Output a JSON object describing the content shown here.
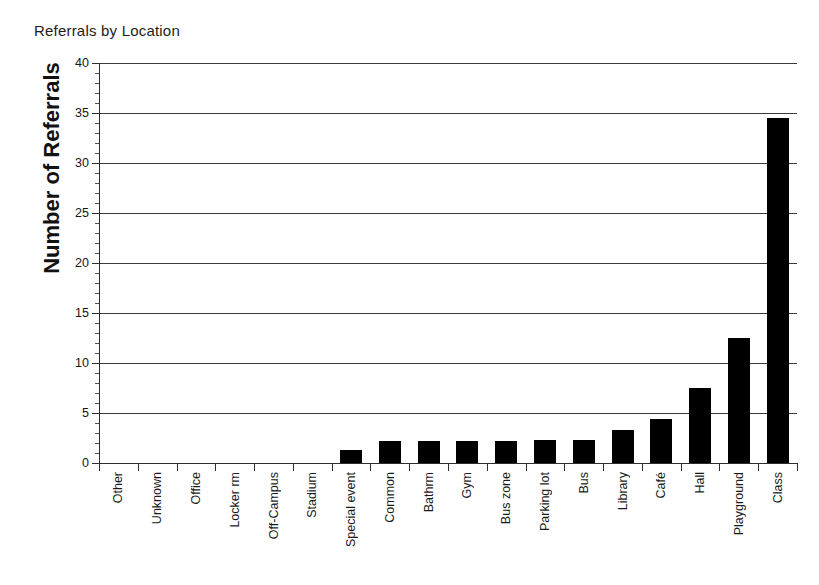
{
  "chart_data": {
    "type": "bar",
    "title": "Referrals by Location",
    "xlabel": "",
    "ylabel": "Number of Referrals",
    "ylim": [
      0,
      40
    ],
    "ytick_step": 5,
    "yminor_step": 1,
    "grid": "horizontal",
    "legend": "none",
    "bar_color": "#000000",
    "categories": [
      "Other",
      "Unknown",
      "Office",
      "Locker rm",
      "Off-Campus",
      "Stadium",
      "Special event",
      "Common",
      "Bathrm",
      "Gym",
      "Bus zone",
      "Parking lot",
      "Bus",
      "Library",
      "Café",
      "Hall",
      "Playground",
      "Class"
    ],
    "values": [
      0,
      0,
      0,
      0,
      0,
      0,
      1.3,
      2.2,
      2.2,
      2.2,
      2.2,
      2.3,
      2.3,
      3.3,
      4.4,
      7.5,
      12.5,
      34.5
    ],
    "ytick_labels": [
      "0",
      "5",
      "10",
      "15",
      "20",
      "25",
      "30",
      "35",
      "40"
    ],
    "ytick_values": [
      0,
      5,
      10,
      15,
      20,
      25,
      30,
      35,
      40
    ]
  }
}
